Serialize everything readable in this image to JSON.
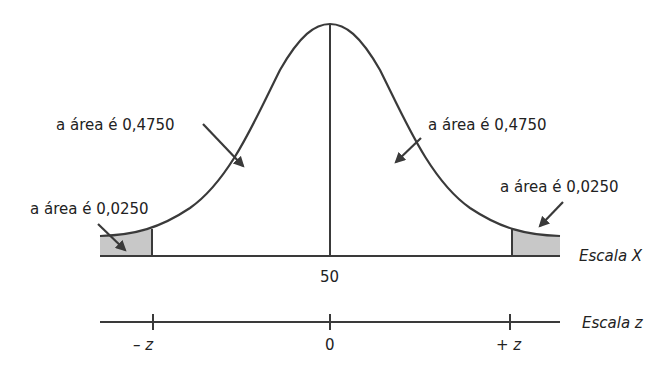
{
  "diagram": {
    "type": "normal-distribution",
    "colors": {
      "line": "#3a3a3a",
      "shade": "#c8c8c8",
      "background": "#ffffff"
    },
    "labels": {
      "left_center_area": "a área é 0,4750",
      "right_center_area": "a área é 0,4750",
      "left_tail_area": "a área é 0,0250",
      "right_tail_area": "a área é 0,0250",
      "x_mean": "50",
      "x_scale": "Escala X",
      "z_scale": "Escala z",
      "z_neg": "– z",
      "z_zero": "0",
      "z_pos": "+ z"
    }
  }
}
